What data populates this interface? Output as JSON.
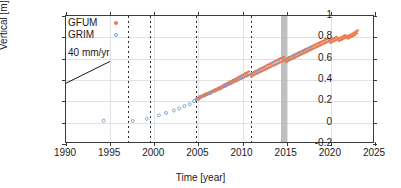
{
  "chart_data": {
    "type": "scatter",
    "title": "",
    "xlabel": "Time [year]",
    "ylabel": "Vertical [m]",
    "xlim": [
      1990,
      2025
    ],
    "ylim": [
      -0.2,
      1.0
    ],
    "xticks": [
      1990,
      1995,
      2000,
      2005,
      2010,
      2015,
      2020,
      2025
    ],
    "xticklabels": [
      "1990",
      "1995",
      "2000",
      "2005",
      "2010",
      "2015",
      "2020",
      "2025"
    ],
    "yticks": [
      -0.2,
      0,
      0.2,
      0.4,
      0.6,
      0.8,
      1
    ],
    "yticklabels": [
      "-0.2",
      "0",
      "0.2",
      "0.4",
      "0.6",
      "0.8",
      "1"
    ],
    "grid": true,
    "legend_position": "upper-left",
    "annotations": [
      {
        "name": "slope-reference",
        "text": "40 mm/yr",
        "x": 1991.2,
        "y": 0.52,
        "line_from": [
          1990.1,
          0.36
        ],
        "line_to": [
          1995.1,
          0.565
        ]
      }
    ],
    "event_lines": [
      {
        "name": "event-1997",
        "x": 1997.0,
        "style": "dashed",
        "color": "#2b2b2b"
      },
      {
        "name": "event-1999",
        "x": 1999.5,
        "style": "dashed",
        "color": "#2b2b2b"
      },
      {
        "name": "event-2004",
        "x": 2004.7,
        "style": "dashed",
        "color": "#2b2b2b"
      },
      {
        "name": "event-2011",
        "x": 2011.0,
        "style": "dashed",
        "color": "#2b2b2b"
      }
    ],
    "event_bands": [
      {
        "name": "event-band-2015",
        "x0": 2014.4,
        "x1": 2015.0,
        "color": "#b4b4b4"
      }
    ],
    "series": [
      {
        "name": "GFUM",
        "color": "#ed7b52",
        "marker": "filled-circle",
        "points": [
          [
            2004.85,
            0.212
          ],
          [
            2004.95,
            0.22
          ],
          [
            2005.05,
            0.228
          ],
          [
            2005.15,
            0.214
          ],
          [
            2005.25,
            0.236
          ],
          [
            2005.35,
            0.228
          ],
          [
            2005.45,
            0.246
          ],
          [
            2005.55,
            0.238
          ],
          [
            2005.65,
            0.254
          ],
          [
            2005.75,
            0.244
          ],
          [
            2005.85,
            0.262
          ],
          [
            2005.95,
            0.252
          ],
          [
            2006.05,
            0.27
          ],
          [
            2006.15,
            0.258
          ],
          [
            2006.25,
            0.276
          ],
          [
            2006.35,
            0.266
          ],
          [
            2006.45,
            0.284
          ],
          [
            2006.55,
            0.274
          ],
          [
            2006.65,
            0.292
          ],
          [
            2006.75,
            0.282
          ],
          [
            2006.85,
            0.3
          ],
          [
            2006.95,
            0.29
          ],
          [
            2007.05,
            0.308
          ],
          [
            2007.15,
            0.296
          ],
          [
            2007.25,
            0.316
          ],
          [
            2007.35,
            0.304
          ],
          [
            2007.45,
            0.324
          ],
          [
            2007.55,
            0.312
          ],
          [
            2007.65,
            0.332
          ],
          [
            2007.75,
            0.32
          ],
          [
            2007.85,
            0.34
          ],
          [
            2007.95,
            0.328
          ],
          [
            2008.05,
            0.352
          ],
          [
            2008.15,
            0.336
          ],
          [
            2008.25,
            0.36
          ],
          [
            2008.35,
            0.344
          ],
          [
            2008.45,
            0.368
          ],
          [
            2008.55,
            0.352
          ],
          [
            2008.65,
            0.378
          ],
          [
            2008.75,
            0.36
          ],
          [
            2008.85,
            0.386
          ],
          [
            2008.95,
            0.368
          ],
          [
            2009.05,
            0.394
          ],
          [
            2009.15,
            0.376
          ],
          [
            2009.25,
            0.402
          ],
          [
            2009.35,
            0.384
          ],
          [
            2009.45,
            0.412
          ],
          [
            2009.55,
            0.392
          ],
          [
            2009.65,
            0.42
          ],
          [
            2009.75,
            0.4
          ],
          [
            2009.85,
            0.43
          ],
          [
            2009.95,
            0.408
          ],
          [
            2010.05,
            0.44
          ],
          [
            2010.15,
            0.416
          ],
          [
            2010.25,
            0.448
          ],
          [
            2010.35,
            0.424
          ],
          [
            2010.45,
            0.458
          ],
          [
            2010.55,
            0.432
          ],
          [
            2010.65,
            0.466
          ],
          [
            2010.75,
            0.44
          ],
          [
            2010.85,
            0.476
          ],
          [
            2010.95,
            0.448
          ],
          [
            2011.05,
            0.452
          ],
          [
            2011.15,
            0.43
          ],
          [
            2011.25,
            0.462
          ],
          [
            2011.35,
            0.44
          ],
          [
            2011.45,
            0.472
          ],
          [
            2011.55,
            0.448
          ],
          [
            2011.65,
            0.48
          ],
          [
            2011.75,
            0.456
          ],
          [
            2011.85,
            0.488
          ],
          [
            2011.95,
            0.464
          ],
          [
            2012.05,
            0.498
          ],
          [
            2012.15,
            0.472
          ],
          [
            2012.25,
            0.506
          ],
          [
            2012.35,
            0.48
          ],
          [
            2012.45,
            0.514
          ],
          [
            2012.55,
            0.488
          ],
          [
            2012.65,
            0.522
          ],
          [
            2012.75,
            0.496
          ],
          [
            2012.85,
            0.532
          ],
          [
            2012.95,
            0.504
          ],
          [
            2013.05,
            0.54
          ],
          [
            2013.15,
            0.512
          ],
          [
            2013.25,
            0.548
          ],
          [
            2013.35,
            0.52
          ],
          [
            2013.45,
            0.556
          ],
          [
            2013.55,
            0.528
          ],
          [
            2013.65,
            0.566
          ],
          [
            2013.75,
            0.536
          ],
          [
            2013.85,
            0.574
          ],
          [
            2013.95,
            0.544
          ],
          [
            2014.05,
            0.582
          ],
          [
            2014.15,
            0.552
          ],
          [
            2014.25,
            0.59
          ],
          [
            2014.35,
            0.56
          ],
          [
            2014.45,
            0.6
          ],
          [
            2014.55,
            0.568
          ],
          [
            2014.65,
            0.606
          ],
          [
            2014.75,
            0.576
          ],
          [
            2014.85,
            0.612
          ],
          [
            2014.95,
            0.582
          ],
          [
            2015.05,
            0.588
          ],
          [
            2015.15,
            0.566
          ],
          [
            2015.25,
            0.6
          ],
          [
            2015.35,
            0.578
          ],
          [
            2015.45,
            0.61
          ],
          [
            2015.55,
            0.586
          ],
          [
            2015.65,
            0.618
          ],
          [
            2015.75,
            0.594
          ],
          [
            2015.85,
            0.626
          ],
          [
            2015.95,
            0.602
          ],
          [
            2016.05,
            0.634
          ],
          [
            2016.15,
            0.61
          ],
          [
            2016.25,
            0.642
          ],
          [
            2016.35,
            0.618
          ],
          [
            2016.45,
            0.65
          ],
          [
            2016.55,
            0.626
          ],
          [
            2016.65,
            0.658
          ],
          [
            2016.75,
            0.634
          ],
          [
            2016.85,
            0.666
          ],
          [
            2016.95,
            0.642
          ],
          [
            2017.05,
            0.674
          ],
          [
            2017.15,
            0.65
          ],
          [
            2017.25,
            0.682
          ],
          [
            2017.35,
            0.658
          ],
          [
            2017.45,
            0.69
          ],
          [
            2017.55,
            0.666
          ],
          [
            2017.65,
            0.698
          ],
          [
            2017.75,
            0.674
          ],
          [
            2017.85,
            0.706
          ],
          [
            2017.95,
            0.682
          ],
          [
            2018.05,
            0.714
          ],
          [
            2018.15,
            0.69
          ],
          [
            2018.25,
            0.722
          ],
          [
            2018.35,
            0.698
          ],
          [
            2018.45,
            0.73
          ],
          [
            2018.55,
            0.706
          ],
          [
            2018.65,
            0.738
          ],
          [
            2018.75,
            0.714
          ],
          [
            2018.85,
            0.746
          ],
          [
            2018.95,
            0.722
          ],
          [
            2019.05,
            0.754
          ],
          [
            2019.15,
            0.73
          ],
          [
            2019.25,
            0.762
          ],
          [
            2019.35,
            0.738
          ],
          [
            2019.45,
            0.77
          ],
          [
            2019.55,
            0.746
          ],
          [
            2019.65,
            0.778
          ],
          [
            2019.75,
            0.754
          ],
          [
            2019.85,
            0.786
          ],
          [
            2019.95,
            0.762
          ],
          [
            2020.05,
            0.77
          ],
          [
            2020.15,
            0.748
          ],
          [
            2020.25,
            0.778
          ],
          [
            2020.35,
            0.756
          ],
          [
            2020.45,
            0.786
          ],
          [
            2020.55,
            0.764
          ],
          [
            2020.65,
            0.794
          ],
          [
            2020.75,
            0.772
          ],
          [
            2020.85,
            0.802
          ],
          [
            2020.95,
            0.78
          ],
          [
            2021.05,
            0.786
          ],
          [
            2021.15,
            0.766
          ],
          [
            2021.25,
            0.794
          ],
          [
            2021.35,
            0.774
          ],
          [
            2021.45,
            0.802
          ],
          [
            2021.55,
            0.782
          ],
          [
            2021.65,
            0.81
          ],
          [
            2021.75,
            0.79
          ],
          [
            2021.85,
            0.818
          ],
          [
            2021.95,
            0.798
          ],
          [
            2022.05,
            0.806
          ],
          [
            2022.15,
            0.788
          ],
          [
            2022.25,
            0.814
          ],
          [
            2022.35,
            0.796
          ],
          [
            2022.45,
            0.822
          ],
          [
            2022.55,
            0.804
          ],
          [
            2022.65,
            0.832
          ],
          [
            2022.75,
            0.812
          ],
          [
            2022.85,
            0.842
          ],
          [
            2022.95,
            0.822
          ],
          [
            2023.05,
            0.852
          ],
          [
            2023.15,
            0.836
          ],
          [
            2023.25,
            0.862
          ]
        ]
      },
      {
        "name": "GRIM",
        "color": "#6f9fd8",
        "marker": "open-circle",
        "points": [
          [
            1994.3,
            0.012
          ],
          [
            1997.6,
            0.01
          ],
          [
            1999.2,
            0.03
          ],
          [
            2000.6,
            0.062
          ],
          [
            2001.4,
            0.085
          ],
          [
            2002.3,
            0.108
          ],
          [
            2002.9,
            0.128
          ],
          [
            2003.5,
            0.15
          ],
          [
            2004.1,
            0.168
          ],
          [
            2004.6,
            0.196
          ],
          [
            2004.9,
            0.215
          ],
          [
            2005.3,
            0.238
          ],
          [
            2005.8,
            0.252
          ],
          [
            2006.4,
            0.272
          ],
          [
            2007.0,
            0.296
          ],
          [
            2007.6,
            0.318
          ],
          [
            2008.2,
            0.342
          ],
          [
            2008.8,
            0.366
          ],
          [
            2009.4,
            0.392
          ],
          [
            2010.0,
            0.416
          ],
          [
            2010.6,
            0.442
          ],
          [
            2011.2,
            0.452
          ],
          [
            2011.8,
            0.472
          ],
          [
            2012.4,
            0.498
          ],
          [
            2013.0,
            0.524
          ],
          [
            2013.6,
            0.548
          ],
          [
            2014.2,
            0.572
          ],
          [
            2014.8,
            0.598
          ],
          [
            2015.4,
            0.602
          ],
          [
            2016.0,
            0.626
          ],
          [
            2016.6,
            0.65
          ],
          [
            2017.2,
            0.674
          ],
          [
            2017.8,
            0.698
          ]
        ]
      }
    ]
  },
  "legend": {
    "entries": [
      {
        "label": "GFUM",
        "marker": "filled-circle",
        "color": "#ed7b52"
      },
      {
        "label": "GRIM",
        "marker": "open-circle",
        "color": "#6f9fd8"
      }
    ]
  },
  "colors": {
    "gfum": "#ed7b52",
    "grim": "#6f9fd8",
    "axis": "#3a3a3a",
    "grid": "#c9c9d6",
    "event_band": "#b4b4b4"
  }
}
